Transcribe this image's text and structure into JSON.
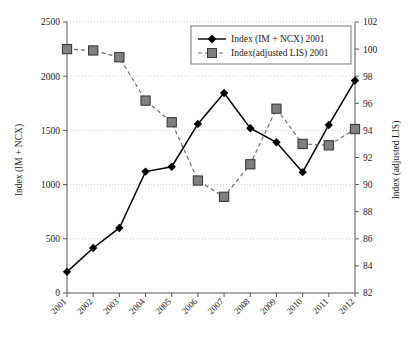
{
  "chart_data": {
    "type": "line",
    "title": "",
    "xlabel": "",
    "categories": [
      "2001",
      "2002",
      "2003",
      "2004",
      "2005",
      "2006",
      "2007",
      "2008",
      "2009",
      "2010",
      "2011",
      "2012"
    ],
    "grid": true,
    "legend_position": "top-right",
    "axes": {
      "left": {
        "label": "Index (IM + NCX)",
        "ticks": [
          0,
          500,
          1000,
          1500,
          2000,
          2500
        ],
        "ylim": [
          0,
          2500
        ]
      },
      "right": {
        "label": "Index (adjusted LIS)",
        "ticks": [
          82,
          84,
          86,
          88,
          90,
          92,
          94,
          96,
          98,
          100,
          102
        ],
        "ylim": [
          82,
          102
        ]
      }
    },
    "series": [
      {
        "name": "Index (IM + NCX) 2001",
        "axis": "left",
        "marker": "diamond",
        "line_style": "solid",
        "color": "#000000",
        "values": [
          195,
          415,
          600,
          1120,
          1165,
          1560,
          1845,
          1520,
          1390,
          1115,
          1550,
          1960
        ]
      },
      {
        "name": "Index(adjusted LIS) 2001",
        "axis": "right",
        "marker": "square",
        "line_style": "dashed",
        "color": "#6e6e6e",
        "values": [
          100.0,
          99.9,
          99.4,
          96.2,
          94.6,
          90.3,
          89.1,
          91.5,
          95.6,
          93.0,
          92.9,
          94.1
        ]
      }
    ]
  },
  "legend": {
    "entries": [
      {
        "label": "Index (IM + NCX) 2001"
      },
      {
        "label": "Index(adjusted LIS) 2001"
      }
    ]
  }
}
